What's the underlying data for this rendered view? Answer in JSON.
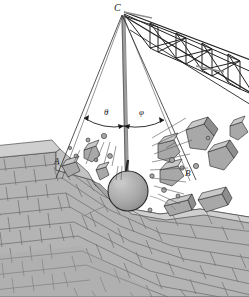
{
  "figure": {
    "type": "mechanics-diagram",
    "background_color": "#ffffff",
    "ink_color": "#1a1a1a"
  },
  "labels": {
    "pivot": "C",
    "position_left": "A",
    "position_right": "B",
    "angle_left": "θ",
    "angle_right": "φ"
  },
  "colors": {
    "brick_face": "#b4b4b4",
    "brick_top": "#cfcfcf",
    "brick_shadow": "#9a9a9a",
    "mortar": "#7d7d7d",
    "ball_fill": "#a9a9a9",
    "ball_highlight": "#c4c4c4",
    "debris_fill": "#a8a8a8",
    "debris_light": "#c8c8c8",
    "debris_dark": "#8e8e8e",
    "cable": "#2a2a2a",
    "boom": "#2a2a2a",
    "mast": "#9e9e9e"
  },
  "geometry": {
    "pivot_point": {
      "x": 122,
      "y": 14
    },
    "ball_center": {
      "x": 128,
      "y": 191
    },
    "ball_radius": 20,
    "cable_left_end": {
      "x": 60,
      "y": 170
    },
    "cable_right_end": {
      "x": 192,
      "y": 175
    },
    "arc_radius": 96,
    "angle_left_label_pos": {
      "x": 108,
      "y": 110
    },
    "angle_right_label_pos": {
      "x": 143,
      "y": 110
    }
  },
  "elements": {
    "crane_boom": "lattice truss boom extending up-right off frame",
    "mast": "vertical crane mast below pivot",
    "cable_center": "vertical hoist cable holding wrecking ball",
    "cable_left": "swing extreme cable to position A",
    "cable_right": "swing extreme cable to position B",
    "wall": "brick masonry wall in perspective, breached at impact point",
    "debris": "flying brick and rubble fragments"
  }
}
